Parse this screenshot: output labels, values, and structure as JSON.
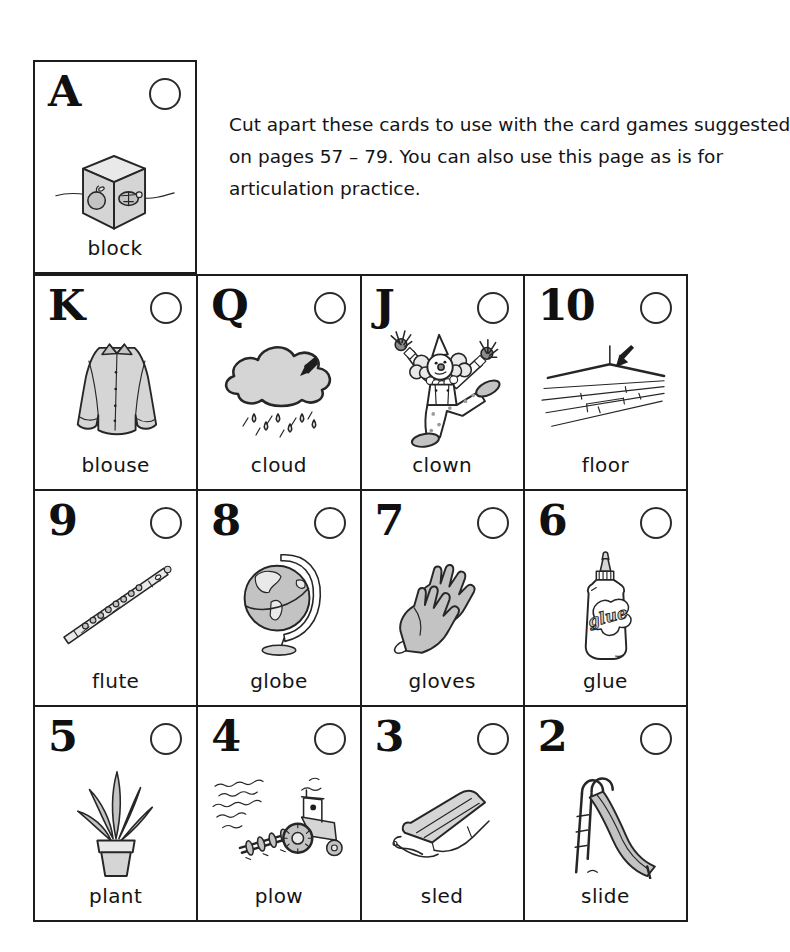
{
  "page": {
    "instructions_lines": [
      "Cut apart these cards to use with the card games suggested",
      "on pages 57 – 79.  You can also use this page as is for",
      "articulation practice."
    ]
  },
  "colors": {
    "ink": "#1c1c1c",
    "illustration_gray": "#c9c9c9",
    "paper": "#ffffff"
  },
  "cards": [
    {
      "rank": "A",
      "label": "block",
      "icon": "block-icon"
    },
    {
      "rank": "K",
      "label": "blouse",
      "icon": "blouse-icon"
    },
    {
      "rank": "Q",
      "label": "cloud",
      "icon": "cloud-icon"
    },
    {
      "rank": "J",
      "label": "clown",
      "icon": "clown-icon"
    },
    {
      "rank": "10",
      "label": "floor",
      "icon": "floor-icon"
    },
    {
      "rank": "9",
      "label": "flute",
      "icon": "flute-icon"
    },
    {
      "rank": "8",
      "label": "globe",
      "icon": "globe-icon"
    },
    {
      "rank": "7",
      "label": "gloves",
      "icon": "gloves-icon"
    },
    {
      "rank": "6",
      "label": "glue",
      "icon": "glue-icon",
      "icon_text": "glue"
    },
    {
      "rank": "5",
      "label": "plant",
      "icon": "plant-icon"
    },
    {
      "rank": "4",
      "label": "plow",
      "icon": "plow-icon"
    },
    {
      "rank": "3",
      "label": "sled",
      "icon": "sled-icon"
    },
    {
      "rank": "2",
      "label": "slide",
      "icon": "slide-icon"
    }
  ]
}
